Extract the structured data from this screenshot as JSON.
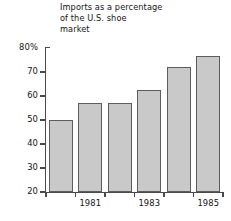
{
  "chart_data": {
    "type": "bar",
    "title": "Imports as a percentage\nof the U.S. shoe\nmarket",
    "xlabel": "",
    "ylabel": "",
    "categories": [
      "1980",
      "1981",
      "1982",
      "1983",
      "1984",
      "1985"
    ],
    "values": [
      50,
      57,
      57,
      62.5,
      72,
      76.5
    ],
    "visible_category_labels": [
      "1981",
      "1983",
      "1985"
    ],
    "visible_category_label_indices": [
      1,
      3,
      5
    ],
    "ylim": [
      20,
      80
    ],
    "yticks": [
      20,
      30,
      40,
      50,
      60,
      70,
      80
    ],
    "ytick_labels": [
      "20",
      "30",
      "40",
      "50",
      "60",
      "70",
      "80%"
    ],
    "grid": false,
    "legend": null,
    "bar_fill_color": "#c9c9c9",
    "bar_edge_color": "#5d5d5d",
    "axis_color": "#4a4a4a",
    "text_color": "#141414",
    "background_color": "#ffffff"
  }
}
